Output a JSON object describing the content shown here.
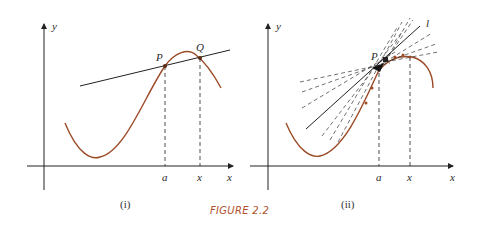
{
  "figure": {
    "caption": "FIGURE 2.2",
    "caption_color": "#b0502a",
    "curve_color": "#9b4a26",
    "line_color": "#222222"
  },
  "panels": [
    {
      "id": "i",
      "label": "(i)",
      "axis_x_label": "x",
      "axis_y_label": "y",
      "point_P_label": "P",
      "point_Q_label": "Q",
      "tick_a_label": "a",
      "tick_x_label": "x",
      "description": "Secant line through P and Q on a curve"
    },
    {
      "id": "ii",
      "label": "(ii)",
      "axis_x_label": "x",
      "axis_y_label": "y",
      "point_P_label": "P",
      "tangent_label": "l",
      "tick_a_label": "a",
      "tick_x_label": "x",
      "description": "Secant lines (dashed) approaching tangent line l at P"
    }
  ]
}
